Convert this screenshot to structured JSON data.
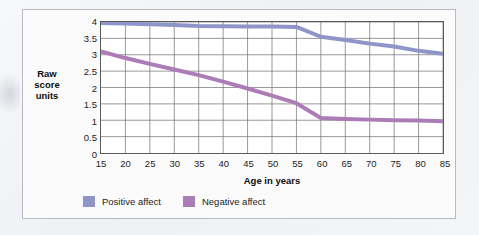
{
  "figure": {
    "background_color": "#fbfbfc",
    "frame_color": "#b7bac0"
  },
  "chart_data": {
    "type": "line",
    "title": "",
    "xlabel": "Age in years",
    "ylabel": "Raw score units",
    "x": [
      15,
      20,
      25,
      30,
      35,
      40,
      45,
      50,
      55,
      60,
      65,
      70,
      75,
      80,
      85
    ],
    "xlim": [
      15,
      85
    ],
    "ylim": [
      0,
      4
    ],
    "xticks": [
      "15",
      "20",
      "25",
      "30",
      "35",
      "40",
      "45",
      "50",
      "55",
      "60",
      "65",
      "70",
      "75",
      "80",
      "85"
    ],
    "yticks": [
      "0",
      "0.5",
      "1",
      "1.5",
      "2",
      "2.5",
      "3",
      "3.5",
      "4"
    ],
    "grid": true,
    "legend_position": "bottom-left",
    "series": [
      {
        "name": "Positive affect",
        "color": "#8f95c9",
        "values": [
          3.97,
          3.95,
          3.93,
          3.91,
          3.88,
          3.87,
          3.86,
          3.86,
          3.85,
          3.55,
          3.45,
          3.34,
          3.25,
          3.12,
          3.03
        ]
      },
      {
        "name": "Negative affect",
        "color": "#ab7cb5",
        "values": [
          3.1,
          2.9,
          2.72,
          2.55,
          2.38,
          2.18,
          1.97,
          1.75,
          1.52,
          1.07,
          1.04,
          1.02,
          1.0,
          0.99,
          0.97
        ]
      }
    ]
  },
  "legend": {
    "items": [
      {
        "label": "Positive affect",
        "color": "#8f95c9"
      },
      {
        "label": "Negative affect",
        "color": "#ab7cb5"
      }
    ]
  },
  "y_axis_title_lines": [
    "Raw",
    "score",
    "units"
  ]
}
